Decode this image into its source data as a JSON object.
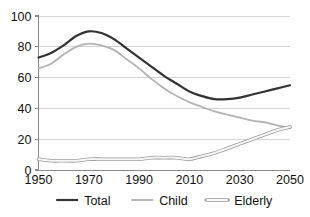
{
  "chart_data": {
    "type": "line",
    "title": "",
    "subtitle": "",
    "xlabel": "",
    "ylabel": "",
    "xlim": [
      1950,
      2050
    ],
    "ylim": [
      0,
      100
    ],
    "grid": "horizontal",
    "legend_position": "bottom",
    "x_ticks": [
      "1950",
      "1970",
      "1990",
      "2010",
      "2030",
      "2050"
    ],
    "x_tick_values": [
      1950,
      1970,
      1990,
      2010,
      2030,
      2050
    ],
    "y_ticks": [
      "0",
      "20",
      "40",
      "60",
      "80",
      "100"
    ],
    "y_tick_values": [
      0,
      20,
      40,
      60,
      80,
      100
    ],
    "x": [
      1950,
      1955,
      1960,
      1965,
      1970,
      1975,
      1980,
      1985,
      1990,
      1995,
      2000,
      2005,
      2010,
      2015,
      2020,
      2025,
      2030,
      2035,
      2040,
      2045,
      2050
    ],
    "series": [
      {
        "name": "Total",
        "color": "#333333",
        "width": 2.2,
        "style": "solid",
        "values": [
          73,
          76,
          81,
          87,
          90,
          89,
          85,
          79,
          73,
          67,
          61,
          56,
          51,
          48,
          46,
          46,
          47,
          49,
          51,
          53,
          55
        ]
      },
      {
        "name": "Child",
        "color": "#b3b3b3",
        "width": 1.8,
        "style": "solid",
        "values": [
          66,
          69,
          75,
          80,
          82,
          81,
          78,
          72,
          66,
          59,
          53,
          48,
          44,
          41,
          38,
          36,
          34,
          32,
          31,
          29,
          27
        ]
      },
      {
        "name": "Elderly",
        "color": "#cfcfcf",
        "outline": "#9a9a9a",
        "width": 3.6,
        "style": "hollow",
        "values": [
          7,
          6,
          6,
          6,
          7,
          7,
          7,
          7,
          7,
          8,
          8,
          8,
          7,
          9,
          11,
          14,
          17,
          20,
          23,
          26,
          28
        ]
      }
    ]
  },
  "legend": {
    "items": [
      {
        "label": "Total",
        "swatch": "solid-dark-line"
      },
      {
        "label": "Child",
        "swatch": "solid-light-line"
      },
      {
        "label": "Elderly",
        "swatch": "hollow-band-line"
      }
    ]
  },
  "colors": {
    "total": "#333333",
    "child": "#b3b3b3",
    "elderly_fill": "#cfcfcf",
    "elderly_outline": "#9a9a9a",
    "gridline": "#c9c9c9",
    "axis": "#8a8a8a",
    "text": "#111111",
    "background": "#ffffff"
  }
}
